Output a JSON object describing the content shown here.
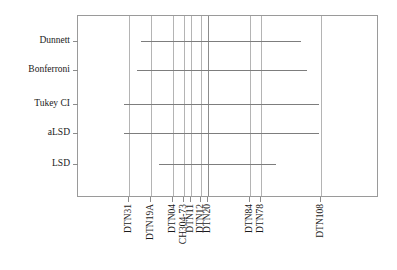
{
  "chart_data": {
    "type": "line",
    "title": "",
    "xlabel": "",
    "ylabel": "",
    "grid": true,
    "legend": false,
    "orientation": "horizontal-intervals",
    "categories": [
      "Dunnett",
      "Bonferroni",
      "Tukey CI",
      "aLSD",
      "LSD"
    ],
    "xtick_labels": [
      "DTN31",
      "DTN19A",
      "DTN04",
      "CH304-73",
      "DTN11",
      "DTN12",
      "DTN20",
      "DTN84",
      "DTN78",
      "DTN108"
    ],
    "xtick_positions": [
      128,
      150,
      172,
      183,
      190,
      200,
      207,
      249,
      260,
      320
    ],
    "series": [
      {
        "name": "Dunnett",
        "y": 40,
        "x_start": 140,
        "x_end": 300
      },
      {
        "name": "Bonferroni",
        "y": 69,
        "x_start": 136,
        "x_end": 306
      },
      {
        "name": "Tukey CI",
        "y": 103,
        "x_start": 123,
        "x_end": 318
      },
      {
        "name": "aLSD",
        "y": 132,
        "x_start": 123,
        "x_end": 318
      },
      {
        "name": "LSD",
        "y": 163,
        "x_start": 158,
        "x_end": 275
      }
    ],
    "axis_color": "#9a9a9a",
    "grid_color": "#b4b4b4",
    "line_color": "#7d7d7d",
    "background": "#ffffff",
    "plot_area": {
      "left": 77,
      "top": 15,
      "width": 301,
      "height": 182
    }
  }
}
